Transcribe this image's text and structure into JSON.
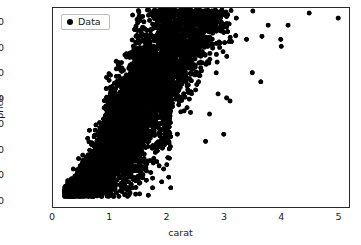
{
  "chart_data": {
    "type": "scatter",
    "title": "",
    "xlabel": "carat",
    "ylabel": "price",
    "xlim": [
      0,
      5.2
    ],
    "ylim": [
      -700,
      19000
    ],
    "xticks": [
      0,
      1,
      2,
      3,
      4,
      5
    ],
    "xticklabels": [
      "0",
      "1",
      "2",
      "3",
      "4",
      "5"
    ],
    "yticks": [
      0,
      2500,
      5000,
      7500,
      10000,
      12500,
      15000,
      17500
    ],
    "yticklabels": [
      "0",
      "2500",
      "5000",
      "7500",
      "10000",
      "12500",
      "15000",
      "17500"
    ],
    "grid": false,
    "legend": {
      "position": "upper left",
      "entries": [
        {
          "label": "Data",
          "marker": "circle",
          "color": "#000000"
        }
      ]
    },
    "marker": {
      "shape": "circle",
      "color": "#000000",
      "size_px": 5
    },
    "series": [
      {
        "name": "Data",
        "description": "Diamond price versus carat weight; dense wedge of points rising steeply from the origin, saturating near the 18800 price ceiling, with vertical striping at round carat values and sparse high-carat outliers.",
        "n_points": 5400,
        "point_clusters": [
          {
            "carat_center": 0.3,
            "price_center": 700,
            "carat_spread": 0.06,
            "price_spread": 280,
            "count": 620
          },
          {
            "carat_center": 0.32,
            "price_center": 900,
            "carat_spread": 0.05,
            "price_spread": 350,
            "count": 460
          },
          {
            "carat_center": 0.4,
            "price_center": 1100,
            "carat_spread": 0.07,
            "price_spread": 420,
            "count": 500
          },
          {
            "carat_center": 0.5,
            "price_center": 1500,
            "carat_spread": 0.06,
            "price_spread": 550,
            "count": 520
          },
          {
            "carat_center": 0.54,
            "price_center": 1750,
            "carat_spread": 0.06,
            "price_spread": 620,
            "count": 330
          },
          {
            "carat_center": 0.62,
            "price_center": 2100,
            "carat_spread": 0.07,
            "price_spread": 750,
            "count": 400
          },
          {
            "carat_center": 0.7,
            "price_center": 2700,
            "carat_spread": 0.07,
            "price_spread": 950,
            "count": 430
          },
          {
            "carat_center": 0.8,
            "price_center": 3200,
            "carat_spread": 0.07,
            "price_spread": 1150,
            "count": 360
          },
          {
            "carat_center": 0.9,
            "price_center": 3900,
            "carat_spread": 0.07,
            "price_spread": 1400,
            "count": 340
          },
          {
            "carat_center": 1.0,
            "price_center": 5200,
            "carat_spread": 0.05,
            "price_spread": 2100,
            "count": 620
          },
          {
            "carat_center": 1.01,
            "price_center": 5600,
            "carat_spread": 0.04,
            "price_spread": 2300,
            "count": 400
          },
          {
            "carat_center": 1.1,
            "price_center": 6100,
            "carat_spread": 0.07,
            "price_spread": 2300,
            "count": 280
          },
          {
            "carat_center": 1.2,
            "price_center": 6800,
            "carat_spread": 0.07,
            "price_spread": 2600,
            "count": 280
          },
          {
            "carat_center": 1.25,
            "price_center": 7200,
            "carat_spread": 0.07,
            "price_spread": 2700,
            "count": 220
          },
          {
            "carat_center": 1.3,
            "price_center": 7600,
            "carat_spread": 0.07,
            "price_spread": 2800,
            "count": 240
          },
          {
            "carat_center": 1.4,
            "price_center": 8400,
            "carat_spread": 0.07,
            "price_spread": 3000,
            "count": 220
          },
          {
            "carat_center": 1.5,
            "price_center": 9300,
            "carat_spread": 0.05,
            "price_spread": 3200,
            "count": 420
          },
          {
            "carat_center": 1.51,
            "price_center": 9700,
            "carat_spread": 0.04,
            "price_spread": 3300,
            "count": 260
          },
          {
            "carat_center": 1.6,
            "price_center": 10200,
            "carat_spread": 0.07,
            "price_spread": 3300,
            "count": 200
          },
          {
            "carat_center": 1.7,
            "price_center": 11000,
            "carat_spread": 0.07,
            "price_spread": 3400,
            "count": 200
          },
          {
            "carat_center": 1.8,
            "price_center": 11800,
            "carat_spread": 0.07,
            "price_spread": 3500,
            "count": 190
          },
          {
            "carat_center": 1.9,
            "price_center": 12600,
            "carat_spread": 0.07,
            "price_spread": 3500,
            "count": 170
          },
          {
            "carat_center": 2.0,
            "price_center": 13600,
            "carat_spread": 0.05,
            "price_spread": 3600,
            "count": 330
          },
          {
            "carat_center": 2.01,
            "price_center": 14000,
            "carat_spread": 0.04,
            "price_spread": 3500,
            "count": 220
          },
          {
            "carat_center": 2.1,
            "price_center": 14400,
            "carat_spread": 0.07,
            "price_spread": 3300,
            "count": 140
          },
          {
            "carat_center": 2.2,
            "price_center": 15000,
            "carat_spread": 0.07,
            "price_spread": 3100,
            "count": 130
          },
          {
            "carat_center": 2.3,
            "price_center": 15500,
            "carat_spread": 0.07,
            "price_spread": 2900,
            "count": 120
          },
          {
            "carat_center": 2.4,
            "price_center": 16000,
            "carat_spread": 0.07,
            "price_spread": 2700,
            "count": 100
          },
          {
            "carat_center": 2.5,
            "price_center": 16500,
            "carat_spread": 0.06,
            "price_spread": 2400,
            "count": 110
          },
          {
            "carat_center": 2.6,
            "price_center": 16900,
            "carat_spread": 0.07,
            "price_spread": 2100,
            "count": 70
          },
          {
            "carat_center": 2.7,
            "price_center": 17200,
            "carat_spread": 0.07,
            "price_spread": 1900,
            "count": 60
          },
          {
            "carat_center": 2.8,
            "price_center": 17400,
            "carat_spread": 0.07,
            "price_spread": 1700,
            "count": 45
          },
          {
            "carat_center": 3.0,
            "price_center": 17600,
            "carat_spread": 0.1,
            "price_spread": 1500,
            "count": 40
          }
        ],
        "outliers": [
          {
            "carat": 3.04,
            "price": 18600
          },
          {
            "carat": 3.22,
            "price": 18000
          },
          {
            "carat": 3.4,
            "price": 15900
          },
          {
            "carat": 3.5,
            "price": 12600
          },
          {
            "carat": 3.51,
            "price": 18700
          },
          {
            "carat": 3.65,
            "price": 11700
          },
          {
            "carat": 3.67,
            "price": 16200
          },
          {
            "carat": 3.78,
            "price": 17300
          },
          {
            "carat": 4.0,
            "price": 15900
          },
          {
            "carat": 4.01,
            "price": 15200
          },
          {
            "carat": 4.13,
            "price": 17300
          },
          {
            "carat": 4.5,
            "price": 18500
          },
          {
            "carat": 5.01,
            "price": 18000
          },
          {
            "carat": 2.9,
            "price": 10500
          },
          {
            "carat": 3.05,
            "price": 10100
          },
          {
            "carat": 3.11,
            "price": 9800
          },
          {
            "carat": 2.75,
            "price": 8500
          },
          {
            "carat": 3.0,
            "price": 6500
          },
          {
            "carat": 2.68,
            "price": 5800
          },
          {
            "carat": 0.64,
            "price": 6900
          }
        ],
        "price_ceiling": 18823,
        "carat_max": 5.01,
        "carat_min": 0.2
      }
    ]
  }
}
